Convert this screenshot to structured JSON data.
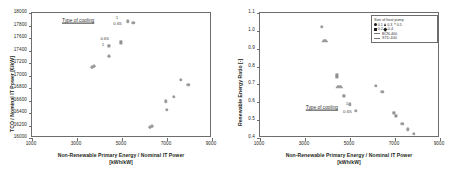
{
  "figure": {
    "panels": [
      "left",
      "right"
    ]
  },
  "chart_data": [
    {
      "type": "scatter",
      "panel": "left",
      "title": "",
      "xlabel": "Non-Renewable Primary Energy / Nominal IT Power",
      "xlabel_units": "[kWh/kW]",
      "ylabel": "TCO / Nominal IT Power  [€/kW]",
      "xlim": [
        1000,
        9000
      ],
      "ylim": [
        16000,
        18000
      ],
      "xticks": [
        1000,
        3000,
        5000,
        7000,
        9000
      ],
      "yticks": [
        16000,
        16200,
        16400,
        16600,
        16800,
        17000,
        17200,
        17400,
        17600,
        17800,
        18000
      ],
      "grid": false,
      "annotations": [
        {
          "text": "Type of cooling",
          "x": 3050,
          "y": 17880,
          "underline": true
        },
        {
          "text": "1",
          "x": 4780,
          "y": 17920
        },
        {
          "text": "0.65",
          "x": 4800,
          "y": 17820
        },
        {
          "text": "0.65",
          "x": 4230,
          "y": 17580
        },
        {
          "text": "1",
          "x": 4150,
          "y": 17490
        }
      ],
      "series": [
        {
          "name": "cluster-upper",
          "marker": "circle",
          "points": [
            {
              "x": 5250,
              "y": 17870
            },
            {
              "x": 5500,
              "y": 17840
            }
          ]
        },
        {
          "name": "cluster-mid",
          "marker": "square",
          "points": [
            {
              "x": 4400,
              "y": 17470
            },
            {
              "x": 4950,
              "y": 17530
            }
          ]
        },
        {
          "name": "cluster-mid-low",
          "marker": "diamond",
          "points": [
            {
              "x": 4400,
              "y": 17320
            },
            {
              "x": 3750,
              "y": 17160
            },
            {
              "x": 3650,
              "y": 17140
            }
          ]
        },
        {
          "name": "cluster-right",
          "marker": "circle",
          "points": [
            {
              "x": 7600,
              "y": 16930
            },
            {
              "x": 7950,
              "y": 16850
            },
            {
              "x": 6950,
              "y": 16590
            },
            {
              "x": 7300,
              "y": 16660
            },
            {
              "x": 6980,
              "y": 16450
            }
          ]
        },
        {
          "name": "cluster-bottom",
          "marker": "diamond",
          "points": [
            {
              "x": 6320,
              "y": 16200
            },
            {
              "x": 6250,
              "y": 16175
            }
          ]
        }
      ]
    },
    {
      "type": "scatter",
      "panel": "right",
      "title": "",
      "xlabel": "Non-Renewable Primary Energy / Nominal IT Power",
      "xlabel_units": "[kWh/kW]",
      "ylabel": "Renewable Energy Ratio  [-]",
      "xlim": [
        1000,
        9000
      ],
      "ylim": [
        0.4,
        1.1
      ],
      "xticks": [
        1000,
        3000,
        5000,
        7000,
        9000
      ],
      "yticks": [
        0.4,
        0.5,
        0.6,
        0.7,
        0.8,
        0.9,
        1.0,
        1.1
      ],
      "grid": false,
      "annotations": [
        {
          "text": "Type of cooling",
          "x": 3750,
          "y": 0.568,
          "underline": true
        },
        {
          "text": "1",
          "x": 4870,
          "y": 0.588
        },
        {
          "text": "0.65",
          "x": 4880,
          "y": 0.545
        }
      ],
      "series": [
        {
          "name": "top-pair",
          "marker": "circle",
          "points": [
            {
              "x": 3760,
              "y": 1.022
            }
          ]
        },
        {
          "name": "top-pair-tri",
          "marker": "triangle",
          "points": [
            {
              "x": 3790,
              "y": 0.962
            }
          ]
        },
        {
          "name": "mid-cluster",
          "marker": "square",
          "points": [
            {
              "x": 4420,
              "y": 0.755
            },
            {
              "x": 4430,
              "y": 0.74
            },
            {
              "x": 4720,
              "y": 0.637
            }
          ]
        },
        {
          "name": "mid-cluster-tri",
          "marker": "triangle",
          "points": [
            {
              "x": 4430,
              "y": 0.703
            }
          ]
        },
        {
          "name": "low-mid",
          "marker": "circle",
          "points": [
            {
              "x": 5000,
              "y": 0.588
            },
            {
              "x": 5250,
              "y": 0.553
            },
            {
              "x": 6160,
              "y": 0.692
            },
            {
              "x": 6430,
              "y": 0.658
            }
          ]
        },
        {
          "name": "right-tail",
          "marker": "square",
          "points": [
            {
              "x": 6960,
              "y": 0.54
            },
            {
              "x": 7030,
              "y": 0.524
            }
          ]
        },
        {
          "name": "right-tail-low",
          "marker": "circle",
          "points": [
            {
              "x": 7330,
              "y": 0.478
            },
            {
              "x": 7560,
              "y": 0.449
            },
            {
              "x": 7830,
              "y": 0.423
            }
          ]
        }
      ],
      "legend": {
        "position": "top-right",
        "title": "Size of heat pump",
        "markers": [
          {
            "label": "0.1",
            "marker": "circle"
          },
          {
            "label": "0.3",
            "marker": "triangle"
          },
          {
            "label": "0.5",
            "marker": "x"
          },
          {
            "label": "0.2",
            "marker": "square"
          },
          {
            "label": "0.4",
            "marker": "diamond"
          }
        ],
        "lines": [
          {
            "label": "BCN-400"
          },
          {
            "label": "STD-400"
          }
        ]
      }
    }
  ]
}
